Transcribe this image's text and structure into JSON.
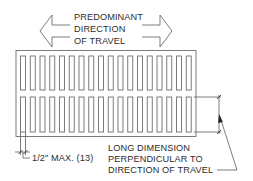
{
  "diagram": {
    "direction_arrow": {
      "lines": [
        "PREDOMINANT",
        "DIRECTION",
        "OF TRAVEL"
      ],
      "icon": "double-headed-arrow-icon"
    },
    "grate": {
      "rows": 2,
      "slots_per_row": 18,
      "icon": "grate-slots"
    },
    "spacing_dimension": {
      "label": "1/2\" MAX. (13)"
    },
    "orientation_note": {
      "lines": [
        "LONG DIMENSION",
        "PERPENDICULAR TO",
        "DIRECTION OF TRAVEL"
      ]
    },
    "colors": {
      "line": "#6e6e6e",
      "text": "#2e2e2e",
      "background": "#ffffff"
    }
  }
}
